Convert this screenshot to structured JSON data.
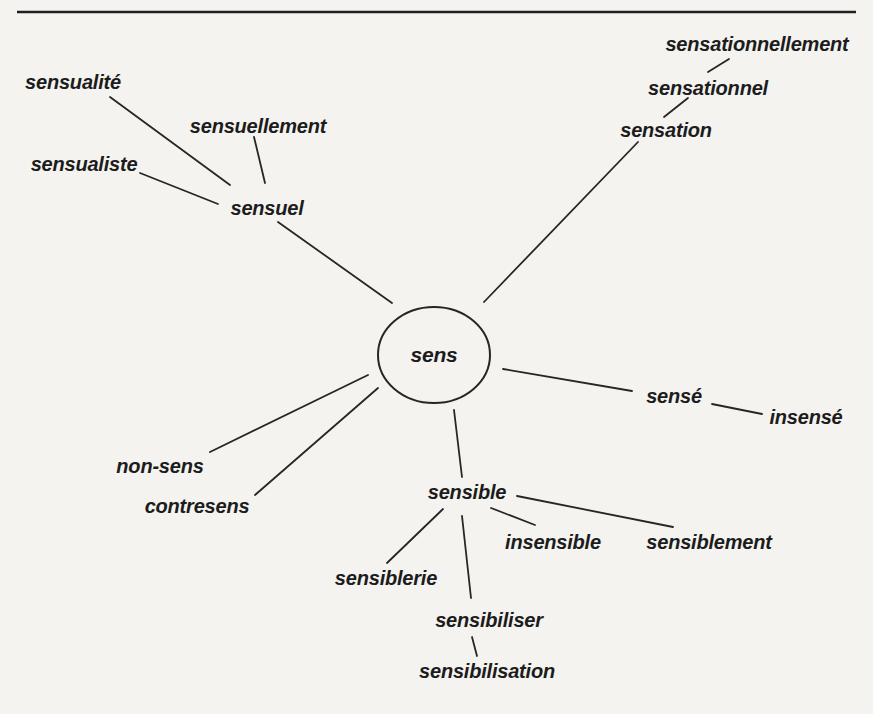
{
  "page": {
    "background": "#f4f3f0",
    "ink": "#262626",
    "rule_color": "#1f1f1f"
  },
  "diagram": {
    "type": "word-family-radial-map",
    "center_word": "sens",
    "top_rule": {
      "x1": 17,
      "y1": 12,
      "x2": 856,
      "y2": 12,
      "stroke_width": 2.6
    },
    "circle": {
      "cx": 434,
      "cy": 355,
      "rx": 56,
      "ry": 48,
      "stroke_width": 2
    },
    "nodes": [
      {
        "id": "sens",
        "label": "sens",
        "x": 434,
        "y": 354,
        "center": true
      },
      {
        "id": "sensualite",
        "label": "sensualité",
        "x": 73,
        "y": 82
      },
      {
        "id": "sensuellement",
        "label": "sensuellement",
        "x": 258,
        "y": 126
      },
      {
        "id": "sensualiste",
        "label": "sensualiste",
        "x": 84,
        "y": 164
      },
      {
        "id": "sensuel",
        "label": "sensuel",
        "x": 267,
        "y": 208
      },
      {
        "id": "sensationnellement",
        "label": "sensationnellement",
        "x": 757,
        "y": 44
      },
      {
        "id": "sensationnel",
        "label": "sensationnel",
        "x": 708,
        "y": 88
      },
      {
        "id": "sensation",
        "label": "sensation",
        "x": 666,
        "y": 130
      },
      {
        "id": "sense",
        "label": "sensé",
        "x": 674,
        "y": 396
      },
      {
        "id": "insense",
        "label": "insensé",
        "x": 806,
        "y": 417
      },
      {
        "id": "non-sens",
        "label": "non-sens",
        "x": 160,
        "y": 466
      },
      {
        "id": "contresens",
        "label": "contresens",
        "x": 197,
        "y": 506
      },
      {
        "id": "sensible",
        "label": "sensible",
        "x": 467,
        "y": 492
      },
      {
        "id": "insensible",
        "label": "insensible",
        "x": 553,
        "y": 542
      },
      {
        "id": "sensiblement",
        "label": "sensiblement",
        "x": 709,
        "y": 542
      },
      {
        "id": "sensiblerie",
        "label": "sensiblerie",
        "x": 386,
        "y": 578
      },
      {
        "id": "sensibiliser",
        "label": "sensibiliser",
        "x": 489,
        "y": 620
      },
      {
        "id": "sensibilisation",
        "label": "sensibilisation",
        "x": 487,
        "y": 671
      }
    ],
    "edges": [
      {
        "from": "sensualite",
        "to": "sensuel",
        "x1": 110,
        "y1": 97,
        "x2": 230,
        "y2": 185
      },
      {
        "from": "sensuellement",
        "to": "sensuel",
        "x1": 254,
        "y1": 137,
        "x2": 265,
        "y2": 183
      },
      {
        "from": "sensualiste",
        "to": "sensuel",
        "x1": 140,
        "y1": 173,
        "x2": 218,
        "y2": 204
      },
      {
        "from": "sensuel",
        "to": "sens",
        "x1": 278,
        "y1": 222,
        "x2": 392,
        "y2": 303
      },
      {
        "from": "sensation",
        "to": "sens",
        "x1": 638,
        "y1": 142,
        "x2": 484,
        "y2": 302
      },
      {
        "from": "sensationnel",
        "to": "sensationnellement",
        "x1": 708,
        "y1": 72,
        "x2": 729,
        "y2": 59
      },
      {
        "from": "sensation",
        "to": "sensationnel",
        "x1": 664,
        "y1": 117,
        "x2": 688,
        "y2": 98
      },
      {
        "from": "sens",
        "to": "sense",
        "x1": 503,
        "y1": 369,
        "x2": 632,
        "y2": 391
      },
      {
        "from": "sense",
        "to": "insense",
        "x1": 712,
        "y1": 404,
        "x2": 762,
        "y2": 414
      },
      {
        "from": "sens",
        "to": "non-sens",
        "x1": 368,
        "y1": 375,
        "x2": 210,
        "y2": 452
      },
      {
        "from": "sens",
        "to": "contresens",
        "x1": 378,
        "y1": 388,
        "x2": 255,
        "y2": 495
      },
      {
        "from": "sens",
        "to": "sensible",
        "x1": 454,
        "y1": 410,
        "x2": 462,
        "y2": 477
      },
      {
        "from": "sensible",
        "to": "sensiblerie",
        "x1": 443,
        "y1": 509,
        "x2": 387,
        "y2": 563
      },
      {
        "from": "sensible",
        "to": "insensible",
        "x1": 491,
        "y1": 508,
        "x2": 535,
        "y2": 525
      },
      {
        "from": "sensible",
        "to": "sensiblement",
        "x1": 517,
        "y1": 496,
        "x2": 673,
        "y2": 527
      },
      {
        "from": "sensible",
        "to": "sensibiliser",
        "x1": 462,
        "y1": 516,
        "x2": 471,
        "y2": 598
      },
      {
        "from": "sensibiliser",
        "to": "sensibilisation",
        "x1": 472,
        "y1": 637,
        "x2": 477,
        "y2": 656
      }
    ]
  }
}
